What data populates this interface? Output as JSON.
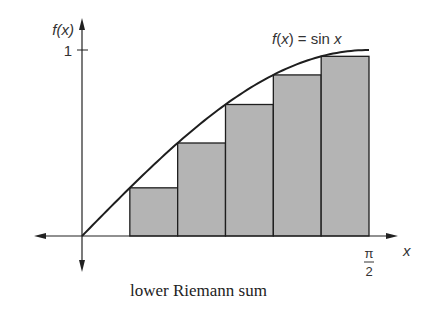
{
  "title": "lower Riemann sum",
  "chart_data": {
    "type": "bar",
    "title": "lower Riemann sum",
    "function_label": "f(x) = sin x",
    "xlabel": "x",
    "ylabel": "f(x)",
    "xlim": [
      0,
      1.5708
    ],
    "ylim": [
      0,
      1
    ],
    "x_tick_labels": [
      {
        "value": 1.5708,
        "numerator": "π",
        "denominator": "2"
      }
    ],
    "y_tick_labels": [
      {
        "value": 1,
        "label": "1"
      }
    ],
    "subintervals": 6,
    "bars": [
      {
        "x_start": 0.2618,
        "x_end": 0.5236,
        "height": 0.259
      },
      {
        "x_start": 0.5236,
        "x_end": 0.7854,
        "height": 0.5
      },
      {
        "x_start": 0.7854,
        "x_end": 1.0472,
        "height": 0.707
      },
      {
        "x_start": 1.0472,
        "x_end": 1.309,
        "height": 0.866
      },
      {
        "x_start": 1.309,
        "x_end": 1.5708,
        "height": 0.966
      }
    ],
    "colors": {
      "bar_fill": "#b4b4b4",
      "stroke": "#1e1e1e"
    }
  }
}
